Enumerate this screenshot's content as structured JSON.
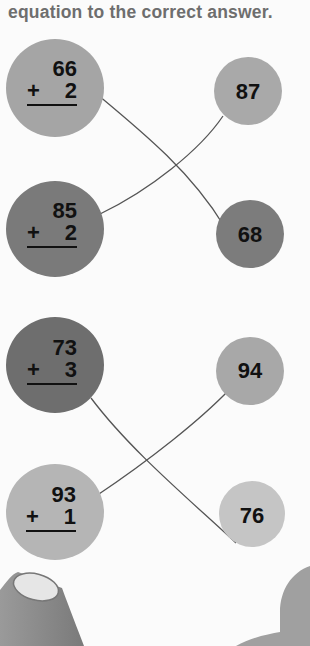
{
  "instructions": {
    "text": "equation to the correct answer."
  },
  "problems": [
    {
      "top": "66",
      "operator": "+",
      "addend": "2",
      "color": "#a5a5a5",
      "answer": "68"
    },
    {
      "top": "85",
      "operator": "+",
      "addend": "2",
      "color": "#7a7a7a",
      "answer": "87"
    },
    {
      "top": "73",
      "operator": "+",
      "addend": "3",
      "color": "#6e6e6e",
      "answer": "76"
    },
    {
      "top": "93",
      "operator": "+",
      "addend": "1",
      "color": "#b5b5b5",
      "answer": "94"
    }
  ],
  "answers": [
    {
      "value": "87",
      "color": "#a9a9a9"
    },
    {
      "value": "68",
      "color": "#7c7c7c"
    },
    {
      "value": "94",
      "color": "#a8a8a8"
    },
    {
      "value": "76",
      "color": "#c5c5c5"
    }
  ]
}
